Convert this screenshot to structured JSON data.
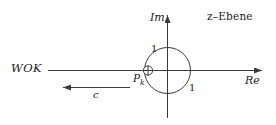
{
  "figure": {
    "plane_label": "z–Ebene",
    "background": "#ffffff",
    "stroke": "#3a3a3a",
    "text_color": "#1a1a1a"
  },
  "axes": {
    "real": {
      "label": "Re",
      "orientation": "horizontal",
      "arrow": "right"
    },
    "imag": {
      "label": "Im",
      "orientation": "vertical",
      "arrow": "up"
    }
  },
  "ticks": [
    {
      "label": "1",
      "axis": "imag",
      "value": 1
    },
    {
      "label": "1",
      "axis": "real",
      "value": 1
    }
  ],
  "unit_circle": {
    "radius_label": "1",
    "center": [
      0,
      0
    ]
  },
  "markers": [
    {
      "symbol": "⊕",
      "name": "pole",
      "label": "P",
      "subscript": "k",
      "on_axis": "real"
    }
  ],
  "annotations": [
    {
      "name": "root-locus",
      "label": "WOK",
      "type": "branch-label"
    },
    {
      "name": "direction-arrow",
      "label": "c",
      "type": "parameter-arrow",
      "direction": "left"
    }
  ]
}
